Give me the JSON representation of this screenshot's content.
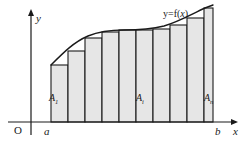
{
  "figure": {
    "background_color": "#ffffff",
    "stroke_color": "#1a1a1a",
    "bar_fill_color": "#e6e6e6"
  },
  "axes": {
    "y_label": "y",
    "x_label": "x",
    "origin_label": "O",
    "lower_bound_label": "a",
    "upper_bound_label": "b",
    "x_axis_y": 122,
    "y_axis_x": 31,
    "x_axis_start": 8,
    "x_axis_end": 231,
    "y_axis_top": 16
  },
  "curve": {
    "label_prefix": "y=f(",
    "label_var": "x",
    "label_suffix": ")",
    "label_full": "y=f(x)",
    "path": "M 51,65 C 64,52 74,42 88,36 C 100,31 112,30 124,30 C 140,30 152,29 164,26 C 178,22 190,15 205,8 L 213,5"
  },
  "bars": [
    {
      "index": 1,
      "x": 51,
      "width": 17,
      "top": 65
    },
    {
      "index": 2,
      "x": 68,
      "width": 17,
      "top": 51
    },
    {
      "index": 3,
      "x": 85,
      "width": 17,
      "top": 38
    },
    {
      "index": 4,
      "x": 102,
      "width": 17,
      "top": 32
    },
    {
      "index": 5,
      "x": 119,
      "width": 17,
      "top": 30
    },
    {
      "index": 6,
      "x": 136,
      "width": 17,
      "top": 30
    },
    {
      "index": 7,
      "x": 153,
      "width": 17,
      "top": 29
    },
    {
      "index": 8,
      "x": 170,
      "width": 17,
      "top": 25
    },
    {
      "index": 9,
      "x": 187,
      "width": 17,
      "top": 18
    },
    {
      "index": 10,
      "x": 204,
      "width": 9,
      "top": 8
    }
  ],
  "bar_labels": [
    {
      "name": "A1",
      "base": "A",
      "sub": "1"
    },
    {
      "name": "Ai",
      "base": "A",
      "sub": "i"
    },
    {
      "name": "An",
      "base": "A",
      "sub": "n"
    }
  ],
  "chart_data": {
    "type": "area",
    "title": "y=f(x)",
    "xlabel": "x",
    "ylabel": "y",
    "interval": [
      "a",
      "b"
    ],
    "subinterval_count": 10,
    "rectangle_labels": [
      "A1",
      "Ai",
      "An"
    ],
    "grid": false,
    "legend": false
  }
}
